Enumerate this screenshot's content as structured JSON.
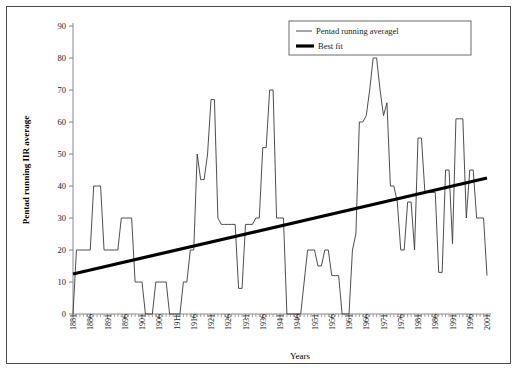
{
  "chart_data": {
    "type": "line",
    "title": "",
    "xlabel": "Years",
    "ylabel": "Pentad running IIR average",
    "xlim": [
      1881,
      2001
    ],
    "ylim": [
      0,
      90
    ],
    "ytick_step": 10,
    "xtick_step": 5,
    "grid": false,
    "legend_position": "top-right",
    "yticks": [
      0,
      10,
      20,
      30,
      40,
      50,
      60,
      70,
      80,
      90
    ],
    "xticks": [
      1881,
      1886,
      1891,
      1896,
      1901,
      1906,
      1911,
      1916,
      1921,
      1926,
      1931,
      1936,
      1941,
      1946,
      1951,
      1956,
      1961,
      1966,
      1971,
      1976,
      1981,
      1986,
      1991,
      1996,
      2001
    ],
    "series": [
      {
        "name": "Pentad running averagel",
        "type": "line",
        "color": "#3a3a3a",
        "x": [
          1881,
          1882,
          1883,
          1884,
          1885,
          1886,
          1887,
          1888,
          1889,
          1890,
          1891,
          1892,
          1893,
          1894,
          1895,
          1896,
          1897,
          1898,
          1899,
          1900,
          1901,
          1902,
          1903,
          1904,
          1905,
          1906,
          1907,
          1908,
          1909,
          1910,
          1911,
          1912,
          1913,
          1914,
          1915,
          1916,
          1917,
          1918,
          1919,
          1920,
          1921,
          1922,
          1923,
          1924,
          1925,
          1926,
          1927,
          1928,
          1929,
          1930,
          1931,
          1932,
          1933,
          1934,
          1935,
          1936,
          1937,
          1938,
          1939,
          1940,
          1941,
          1942,
          1943,
          1944,
          1945,
          1946,
          1947,
          1948,
          1949,
          1950,
          1951,
          1952,
          1953,
          1954,
          1955,
          1956,
          1957,
          1958,
          1959,
          1960,
          1961,
          1962,
          1963,
          1964,
          1965,
          1966,
          1967,
          1968,
          1969,
          1970,
          1971,
          1972,
          1973,
          1974,
          1975,
          1976,
          1977,
          1978,
          1979,
          1980,
          1981,
          1982,
          1983,
          1984,
          1985,
          1986,
          1987,
          1988,
          1989,
          1990,
          1991,
          1992,
          1993,
          1994,
          1995,
          1996,
          1997,
          1998,
          1999,
          2000,
          2001
        ],
        "values": [
          0,
          20,
          20,
          20,
          20,
          20,
          40,
          40,
          40,
          20,
          20,
          20,
          20,
          20,
          30,
          30,
          30,
          30,
          10,
          10,
          10,
          0,
          0,
          0,
          10,
          10,
          10,
          10,
          0,
          0,
          0,
          0,
          10,
          10,
          20,
          20,
          50,
          42,
          42,
          50,
          67,
          67,
          30,
          28,
          28,
          28,
          28,
          28,
          8,
          8,
          28,
          28,
          28,
          30,
          30,
          52,
          52,
          70,
          70,
          30,
          30,
          30,
          0,
          0,
          0,
          0,
          0,
          10,
          20,
          20,
          20,
          15,
          15,
          20,
          20,
          12,
          12,
          12,
          0,
          0,
          0,
          20,
          25,
          60,
          60,
          62,
          70,
          80,
          80,
          70,
          62,
          66,
          40,
          40,
          35,
          20,
          20,
          35,
          35,
          20,
          55,
          55,
          38,
          38,
          38,
          38,
          13,
          13,
          45,
          45,
          22,
          61,
          61,
          61,
          30,
          45,
          45,
          30,
          30,
          30,
          12
        ]
      },
      {
        "name": "Best fit",
        "type": "line",
        "color": "#000000",
        "x": [
          1881,
          2001
        ],
        "values": [
          12.5,
          42.5
        ]
      }
    ]
  },
  "legend": {
    "entries": [
      {
        "label": "Pentad running averagel",
        "swatch": "thin-line"
      },
      {
        "label": "Best fit",
        "swatch": "thick-line"
      }
    ]
  },
  "axes": {
    "x_title": "Years",
    "y_title": "Pentad running IIR average"
  },
  "colors": {
    "series": "#3a3a3a",
    "fit": "#000000",
    "axis": "#8a8a8a",
    "border": "#4a4a4a",
    "background": "#ffffff"
  }
}
